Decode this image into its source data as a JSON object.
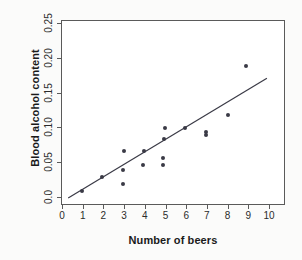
{
  "chart_data": {
    "type": "scatter",
    "title": "",
    "xlabel": "Number of beers",
    "ylabel": "Blood alcohol content",
    "xlim": [
      0,
      10
    ],
    "ylim": [
      0.0,
      0.25
    ],
    "grid": false,
    "legend": "none",
    "xticks": [
      "0",
      "1",
      "2",
      "3",
      "4",
      "5",
      "6",
      "7",
      "8",
      "9",
      "10"
    ],
    "xtick_values": [
      0,
      1,
      2,
      3,
      4,
      5,
      6,
      7,
      8,
      9,
      10
    ],
    "yticks": [
      "0.0",
      "0.05",
      "0.10",
      "0.15",
      "0.20",
      "0.25"
    ],
    "ytick_values": [
      0.0,
      0.05,
      0.1,
      0.15,
      0.2,
      0.25
    ],
    "marker_color": "#3a3a46",
    "line_color": "#3a3a46",
    "axis_color": "#5a5a5a",
    "points": [
      {
        "x": 0.9,
        "y": 0.01
      },
      {
        "x": 1.9,
        "y": 0.03
      },
      {
        "x": 2.9,
        "y": 0.02
      },
      {
        "x": 2.9,
        "y": 0.04
      },
      {
        "x": 2.95,
        "y": 0.068
      },
      {
        "x": 3.85,
        "y": 0.048
      },
      {
        "x": 3.9,
        "y": 0.068
      },
      {
        "x": 4.85,
        "y": 0.048
      },
      {
        "x": 4.85,
        "y": 0.057
      },
      {
        "x": 4.9,
        "y": 0.085
      },
      {
        "x": 4.95,
        "y": 0.1
      },
      {
        "x": 5.9,
        "y": 0.1
      },
      {
        "x": 6.9,
        "y": 0.09
      },
      {
        "x": 6.9,
        "y": 0.095
      },
      {
        "x": 7.95,
        "y": 0.119
      },
      {
        "x": 8.85,
        "y": 0.19
      }
    ],
    "fit_line": {
      "label": "least-squares regression line",
      "x_start": 0.25,
      "y_start": 0.0,
      "x_end": 9.85,
      "y_end": 0.172
    }
  }
}
